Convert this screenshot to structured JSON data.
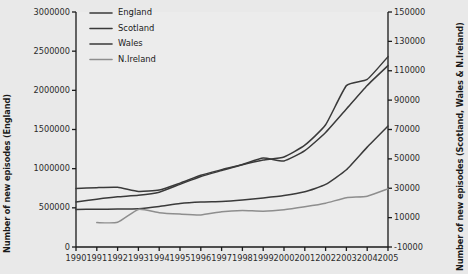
{
  "chart_data": {
    "type": "line",
    "title": "",
    "xlabel": "",
    "ylabel": "Number of new episodes (England)",
    "ylabel_right": "Number of new episodes (Scotland, Wales & N.Ireland)",
    "x": [
      1990,
      1991,
      1992,
      1993,
      1994,
      1995,
      1996,
      1997,
      1998,
      1999,
      2000,
      2001,
      2002,
      2003,
      2004,
      2005
    ],
    "xtick_labels": [
      "1990",
      "1991",
      "1992",
      "1993",
      "1994",
      "1995",
      "1996",
      "1997",
      "1998",
      "1999",
      "2000",
      "2001",
      "2002",
      "2003",
      "2004",
      "2005"
    ],
    "xlim": [
      1990,
      2005
    ],
    "ylim": [
      0,
      3000000
    ],
    "ytick_labels": [
      "3000000",
      "2500000",
      "2000000",
      "1500000",
      "1000000",
      "500000",
      "0"
    ],
    "ytick_values": [
      3000000,
      2500000,
      2000000,
      1500000,
      1000000,
      500000,
      0
    ],
    "ylim_right": [
      -10000,
      150000
    ],
    "ytick_labels_right": [
      "150000",
      "130000",
      "110000",
      "90000",
      "70000",
      "50000",
      "30000",
      "10000",
      "-10000"
    ],
    "ytick_values_right": [
      150000,
      130000,
      110000,
      90000,
      70000,
      50000,
      30000,
      10000,
      -10000
    ],
    "grid": false,
    "legend_position": "top-left",
    "series": [
      {
        "name": "England",
        "axis": "left",
        "color": "#3a3a3a",
        "values": [
          575000,
          610000,
          640000,
          660000,
          700000,
          800000,
          900000,
          975000,
          1050000,
          1110000,
          1150000,
          1300000,
          1560000,
          2060000,
          2140000,
          2430000
        ]
      },
      {
        "name": "Scotland",
        "axis": "right",
        "color": "#3a3a3a",
        "values": [
          29800,
          30400,
          30600,
          27800,
          28800,
          33500,
          38800,
          42600,
          46200,
          50600,
          48600,
          55600,
          68000,
          84000,
          100000,
          113500
        ]
      },
      {
        "name": "Wales",
        "axis": "right",
        "color": "#3a3a3a",
        "values": [
          15600,
          15700,
          15800,
          16100,
          17600,
          19600,
          20600,
          21000,
          22000,
          23400,
          25000,
          27600,
          32600,
          42600,
          58000,
          72400
        ]
      },
      {
        "name": "N.Ireland",
        "axis": "right",
        "color": "#8e8e8e",
        "values": [
          null,
          6600,
          6800,
          15600,
          13400,
          12400,
          11800,
          14000,
          14800,
          14400,
          15400,
          17400,
          19800,
          23600,
          24600,
          29600
        ]
      }
    ]
  },
  "legend": {
    "items": [
      {
        "label": "England",
        "color": "#3a3a3a"
      },
      {
        "label": "Scotland",
        "color": "#3a3a3a"
      },
      {
        "label": "Wales",
        "color": "#3a3a3a"
      },
      {
        "label": "N.Ireland",
        "color": "#8e8e8e"
      }
    ]
  },
  "colors": {
    "figure_background": "#e9e9e9",
    "plot_background": "#ececec",
    "axis": "#1a1a1a",
    "text": "#1a1a1a",
    "dark_series": "#3a3a3a",
    "light_series": "#8e8e8e"
  }
}
